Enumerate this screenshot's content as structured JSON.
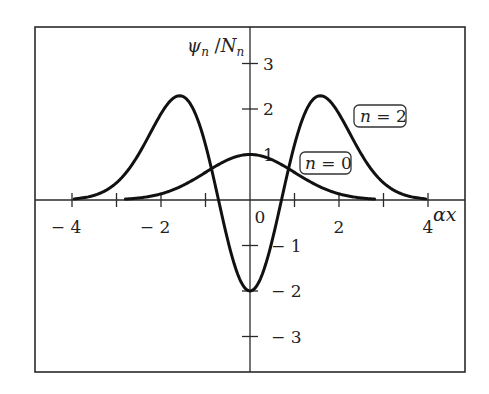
{
  "chart_data": {
    "type": "line",
    "title": "",
    "xlabel": "αx",
    "ylabel": "ψn / Nn",
    "xlim": [
      -4.45,
      4.9
    ],
    "ylim": [
      -3.8,
      3.8
    ],
    "grid": false,
    "x_ticks": [
      -4,
      -3,
      -2,
      -1,
      0,
      1,
      2,
      3,
      4
    ],
    "x_tick_labels": [
      {
        "value": -4,
        "label": "− 4"
      },
      {
        "value": -2,
        "label": "− 2"
      },
      {
        "value": 0,
        "label": "0"
      },
      {
        "value": 2,
        "label": "2"
      },
      {
        "value": 4,
        "label": "4"
      }
    ],
    "y_ticks": [
      -3,
      -2,
      -1,
      1,
      2,
      3
    ],
    "y_tick_labels": [
      {
        "value": 3,
        "label": "3"
      },
      {
        "value": 2,
        "label": "2"
      },
      {
        "value": 1,
        "label": "1"
      },
      {
        "value": -1,
        "label": "− 1"
      },
      {
        "value": -2,
        "label": "− 2"
      },
      {
        "value": -3,
        "label": "− 3"
      }
    ],
    "legend_position": "inline-boxed-labels",
    "series": [
      {
        "name": "n = 0",
        "formula": "exp(-x^2/2)",
        "x_range": [
          -2.8,
          2.8
        ],
        "x": [
          -2.8,
          -2.4,
          -2.0,
          -1.6,
          -1.2,
          -0.8,
          -0.4,
          0.0,
          0.4,
          0.8,
          1.2,
          1.6,
          2.0,
          2.4,
          2.8
        ],
        "values": [
          0.02,
          0.056,
          0.135,
          0.278,
          0.487,
          0.726,
          0.923,
          1.0,
          0.923,
          0.726,
          0.487,
          0.278,
          0.135,
          0.056,
          0.02
        ]
      },
      {
        "name": "n = 2",
        "formula": "(4x^2 - 2) exp(-x^2/2)",
        "x_range": [
          -3.95,
          3.95
        ],
        "x": [
          -3.95,
          -3.5,
          -3.0,
          -2.5,
          -2.0,
          -1.58,
          -1.2,
          -0.71,
          -0.4,
          0.0,
          0.4,
          0.71,
          1.2,
          1.58,
          2.0,
          2.5,
          3.0,
          3.5,
          3.95
        ],
        "values": [
          0.026,
          0.105,
          0.377,
          1.054,
          1.895,
          2.29,
          1.851,
          0.0,
          -1.29,
          -2.0,
          -1.29,
          0.0,
          1.851,
          2.29,
          1.895,
          1.054,
          0.377,
          0.105,
          0.026
        ]
      }
    ],
    "annotations": [
      {
        "text_var": "n",
        "text_rest": " = 2",
        "series": "n = 2"
      },
      {
        "text_var": "n",
        "text_rest": " = 0",
        "series": "n = 0"
      }
    ]
  },
  "labels": {
    "x_axis": {
      "var": "αx"
    },
    "y_axis": {
      "psi": "ψ",
      "sub_n1": "n",
      "slash": " /",
      "N": "N",
      "sub_n2": "n"
    },
    "legend_n2": {
      "var": "n",
      "rest": " = 2"
    },
    "legend_n0": {
      "var": "n",
      "rest": " = 0"
    }
  }
}
